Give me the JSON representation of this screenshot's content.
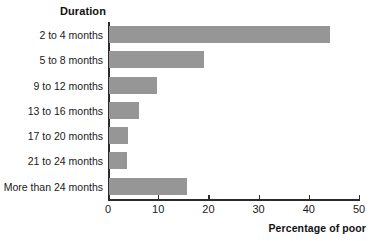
{
  "chart_data": {
    "type": "bar",
    "orientation": "horizontal",
    "title": "",
    "category_axis_title": "Duration",
    "xlabel": "Percentage of poor",
    "ylabel": "Duration",
    "categories": [
      "2 to 4 months",
      "5 to 8 months",
      "9 to 12 months",
      "13 to 16 months",
      "17 to 20 months",
      "21 to 24 months",
      "More than 24 months"
    ],
    "values": [
      44,
      19,
      9.5,
      6,
      3.8,
      3.5,
      15.5
    ],
    "xlim": [
      0,
      50
    ],
    "xticks": [
      0,
      10,
      20,
      30,
      40,
      50
    ],
    "xtick_labels": [
      "0",
      "10",
      "20",
      "30",
      "40",
      "50"
    ],
    "grid": false,
    "legend": false,
    "bar_color": "#969696",
    "axis_color": "#2b2b2b",
    "background": "#ffffff"
  }
}
